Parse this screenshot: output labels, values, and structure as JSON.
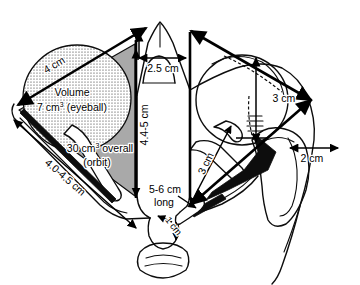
{
  "figure": {
    "type": "anatomical-line-diagram",
    "background_color": "#ffffff",
    "ink_color": "#0d0d0d",
    "orbit_shading_color": "#a9a9a9",
    "eyeball_stipple_color": "#0d0d0d"
  },
  "labels": {
    "eyeball_diameter": "4 cm",
    "eyeball_volume_line1": "Volume",
    "eyeball_volume_value": "7 cm",
    "eyeball_volume_sup": "3",
    "eyeball_volume_unit": " (eyeball)",
    "orbit_volume_value": "30 cm",
    "orbit_volume_sup": "3",
    "orbit_volume_unit": " overall",
    "orbit_volume_line2": "(orbit)",
    "orbit_lateral_wall": "4.0-4.5 cm",
    "optic_canal_width": "2.5 cm",
    "orbit_height": "4.4-5 cm",
    "optic_nerve_length_line1": "5-6 cm",
    "optic_nerve_length_line2": "long",
    "orbit_apex_depth": "3 cm",
    "optic_nerve_intraorbital": "3 cm",
    "nerve_short_segment": "1 cm",
    "maxillary_sinus_width": "2 cm"
  }
}
